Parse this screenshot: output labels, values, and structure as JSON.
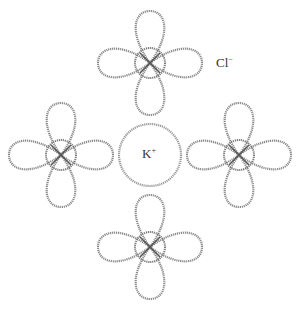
{
  "diagram": {
    "cation": {
      "symbol": "K",
      "charge": "+",
      "cx": 150,
      "cy": 155,
      "r": 31
    },
    "anion_label": {
      "symbol": "Cl",
      "charge": "−",
      "x": 222,
      "y": 63
    },
    "anion_orbitals": [
      {
        "name": "top",
        "cx": 150,
        "cy": 63
      },
      {
        "name": "left",
        "cx": 61,
        "cy": 155
      },
      {
        "name": "right",
        "cx": 239,
        "cy": 155
      },
      {
        "name": "bottom",
        "cx": 150,
        "cy": 247
      }
    ],
    "colors": {
      "stroke": "#8a8a8a",
      "background": "#ffffff"
    }
  }
}
